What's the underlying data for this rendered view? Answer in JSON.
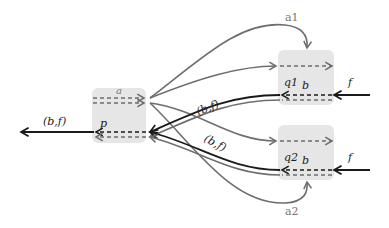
{
  "diagram": {
    "colors": {
      "box_fill": "#e6e6e6",
      "black_line": "#1a1a1a",
      "gray_line": "#6e6e6e",
      "background": "#ffffff"
    },
    "nodes": {
      "p": {
        "label": "p",
        "top_channel_label": "a"
      },
      "q1": {
        "label": "q1",
        "channel_label": "b"
      },
      "q2": {
        "label": "q2",
        "channel_label": "b"
      }
    },
    "edges": {
      "output_left": {
        "label": "(b,f)"
      },
      "input_q1": {
        "label": "f"
      },
      "input_q2": {
        "label": "f"
      },
      "cross_upper": {
        "label": "(b,f)"
      },
      "cross_lower": {
        "label": "(b,f)"
      },
      "a1": {
        "label": "a1"
      },
      "a2": {
        "label": "a2"
      }
    }
  }
}
